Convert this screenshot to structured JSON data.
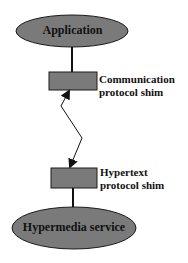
{
  "diagram": {
    "nodes": {
      "application": {
        "label": "Application",
        "shape": "ellipse"
      },
      "communication_shim": {
        "label_line1": "Communication",
        "label_line2": "protocol shim",
        "shape": "rectangle"
      },
      "hypertext_shim": {
        "label_line1": "Hypertext",
        "label_line2": "protocol shim",
        "shape": "rectangle"
      },
      "hypermedia_service": {
        "label": "Hypermedia service",
        "shape": "ellipse"
      }
    },
    "edges": [
      {
        "from": "application",
        "to": "communication_shim",
        "type": "line"
      },
      {
        "from": "communication_shim",
        "to": "hypertext_shim",
        "type": "zigzag-bidirectional-arrow"
      },
      {
        "from": "hypertext_shim",
        "to": "hypermedia_service",
        "type": "line"
      }
    ],
    "colors": {
      "fill": "#7a7a7a",
      "stroke": "#1a1a1a",
      "text": "#111111"
    }
  }
}
